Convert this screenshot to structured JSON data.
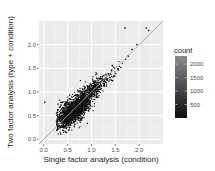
{
  "chart_data": {
    "type": "scatter",
    "subtype": "hex/bin density scatter with identity line",
    "title": "",
    "xlabel": "Single factor analysis (condition)",
    "ylabel": "Two factor analysis (type + condition)",
    "xlim": [
      -0.1,
      2.5
    ],
    "ylim": [
      -0.1,
      2.5
    ],
    "x_ticks": [
      0.0,
      0.5,
      1.0,
      1.5,
      2.0
    ],
    "x_tick_labels": [
      "0.0",
      "0.5",
      "1.0",
      "1.5",
      "2.0"
    ],
    "y_ticks": [
      0.0,
      0.5,
      1.0,
      1.5,
      2.0
    ],
    "y_tick_labels": [
      "0.0",
      "0.5",
      "1.0",
      "1.5",
      "2.0"
    ],
    "grid": true,
    "reference_line": {
      "slope": 1,
      "intercept": 0,
      "color": "#a0a0a0"
    },
    "legend": {
      "title": "count",
      "position": "right",
      "type": "colorbar",
      "range": [
        1,
        2300
      ],
      "breaks": [
        500,
        1000,
        1500,
        2000
      ],
      "break_labels": [
        "500",
        "1000",
        "1500",
        "2000"
      ],
      "low_color": "#0d0d0d",
      "high_color": "#8c8c8c"
    },
    "density_core": {
      "description": "dense cloud concentrated along y≈x, mostly between x 0.3–1.3",
      "center": [
        0.6,
        0.6
      ],
      "x_range": [
        0.25,
        1.6
      ],
      "y_range": [
        0.15,
        1.65
      ]
    },
    "outliers": [
      {
        "x": 1.7,
        "y": 2.35
      },
      {
        "x": 2.15,
        "y": 2.35
      },
      {
        "x": 2.2,
        "y": 2.3
      },
      {
        "x": 0.02,
        "y": 0.78
      },
      {
        "x": 1.95,
        "y": 2.0
      },
      {
        "x": 1.85,
        "y": 1.9
      },
      {
        "x": 0.3,
        "y": 0.28
      }
    ],
    "colors": {
      "panel_background": "#ebebeb",
      "grid_major": "#ffffff",
      "grid_minor": "#f5f5f5",
      "points": "#111111"
    }
  }
}
